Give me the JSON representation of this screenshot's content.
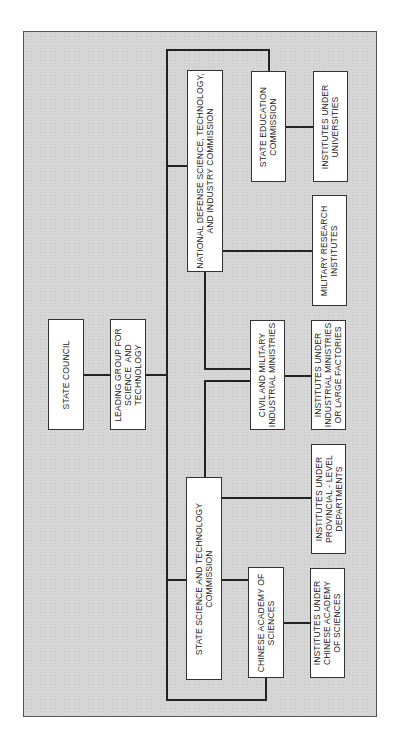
{
  "diagram": {
    "type": "organization-chart",
    "orientation": "rotated-90-ccw",
    "nodes": {
      "state_council": "STATE COUNCIL",
      "leading_group": "LEADING GROUP FOR\nSCIENCE  AND\nTECHNOLOGY",
      "ndstic": "NATIONAL DEFENSE SCIENCE, TECHNOLOGY,\nAND INDUSTRY COMMISSION",
      "state_education": "STATE EDUCATION\nCOMMISSION",
      "inst_universities": "INSTITUTES UNDER\nUNIVERSITIES",
      "military_research": "MILITARY RESEARCH\nINSTITUTES",
      "civil_military": "CIVIL AND MILITARY\nINDUSTRIAL MINISTRIES",
      "inst_industrial": "INSTITUTES UNDER\nINDUSTRIAL MINISTRIES\nOR LARGE FACTORIES",
      "sstc": "STATE SCIENCE AND TECHNOLOGY\nCOMMISSION",
      "inst_provincial": "INSTITUTES UNDER\nPROVINCIAL - LEVEL\nDEPARTMENTS",
      "cas": "CHINESE ACADEMY OF\nSCIENCES",
      "inst_cas": "INSTITUTES UNDER\nCHINESE ACADEMY\nOF SCIENCES"
    },
    "edges": [
      [
        "state_council",
        "leading_group"
      ],
      [
        "leading_group",
        "ndstic"
      ],
      [
        "leading_group",
        "state_education"
      ],
      [
        "leading_group",
        "sstc"
      ],
      [
        "leading_group",
        "cas"
      ],
      [
        "state_education",
        "inst_universities"
      ],
      [
        "ndstic",
        "military_research"
      ],
      [
        "ndstic",
        "civil_military"
      ],
      [
        "sstc",
        "civil_military"
      ],
      [
        "civil_military",
        "inst_industrial"
      ],
      [
        "sstc",
        "inst_provincial"
      ],
      [
        "cas",
        "inst_cas"
      ]
    ],
    "colors": {
      "panel": "#d6d6d6",
      "box": "#ffffff",
      "line": "#222222"
    }
  }
}
